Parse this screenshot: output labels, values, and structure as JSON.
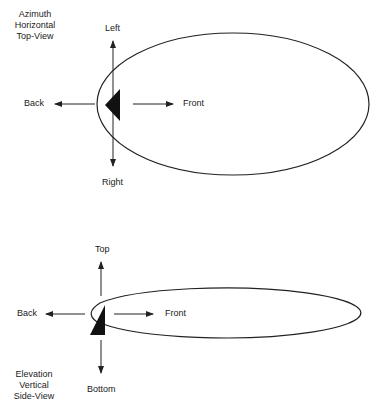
{
  "top_view": {
    "title_lines": [
      "Azimuth",
      "Horizontal",
      "Top-View"
    ],
    "labels": {
      "left": "Left",
      "right": "Right",
      "back": "Back",
      "front": "Front"
    }
  },
  "side_view": {
    "title_lines": [
      "Elevation",
      "Vertical",
      "Side-View"
    ],
    "labels": {
      "top": "Top",
      "bottom": "Bottom",
      "back": "Back",
      "front": "Front"
    }
  },
  "colors": {
    "line": "#222222",
    "fill": "#111111",
    "background": "#ffffff"
  }
}
